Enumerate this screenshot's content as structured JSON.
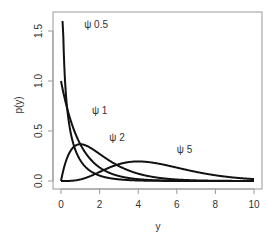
{
  "chart_data": {
    "type": "line",
    "title": "",
    "xlabel": "y",
    "ylabel": "p(y)",
    "xlim": [
      0,
      10
    ],
    "ylim": [
      0,
      1.6
    ],
    "grid": false,
    "legend": "none (inline labels)",
    "x_ticks": [
      0,
      2,
      4,
      6,
      8,
      10
    ],
    "x_tick_labels": [
      "0",
      "2",
      "4",
      "6",
      "8",
      "10"
    ],
    "y_ticks": [
      0.0,
      0.5,
      1.0,
      1.5
    ],
    "y_tick_labels": [
      "0.0",
      "0.5",
      "1.0",
      "1.5"
    ],
    "series": [
      {
        "name": "ψ 0.5",
        "shape": 0.5,
        "label": "ψ  0.5",
        "label_at": [
          1.2,
          1.53
        ],
        "x": [
          0.02,
          0.05,
          0.1,
          0.2,
          0.3,
          0.5,
          0.75,
          1,
          1.5,
          2,
          3,
          4,
          5,
          6,
          8,
          10
        ],
        "values": [
          1.6,
          1.6,
          1.6,
          1.04,
          0.76,
          0.48,
          0.31,
          0.21,
          0.1,
          0.05,
          0.014,
          0.004,
          0.001,
          0.0,
          0.0,
          0.0
        ]
      },
      {
        "name": "ψ 1",
        "shape": 1,
        "label": "ψ  1",
        "label_at": [
          1.6,
          0.67
        ],
        "x": [
          0,
          0.5,
          1,
          1.5,
          2,
          3,
          4,
          5,
          6,
          8,
          10
        ],
        "values": [
          1.0,
          0.61,
          0.37,
          0.22,
          0.14,
          0.05,
          0.02,
          0.007,
          0.002,
          0.0,
          0.0
        ]
      },
      {
        "name": "ψ 2",
        "shape": 2,
        "label": "ψ  2",
        "label_at": [
          2.5,
          0.4
        ],
        "x": [
          0,
          0.5,
          1,
          1.5,
          2,
          3,
          4,
          5,
          6,
          8,
          10
        ],
        "values": [
          0.0,
          0.3,
          0.37,
          0.33,
          0.27,
          0.15,
          0.07,
          0.03,
          0.015,
          0.003,
          0.0
        ]
      },
      {
        "name": "ψ 5",
        "shape": 5,
        "label": "ψ  5",
        "label_at": [
          6.0,
          0.28
        ],
        "x": [
          0,
          1,
          2,
          3,
          4,
          5,
          6,
          7,
          8,
          9,
          10
        ],
        "values": [
          0.0,
          0.015,
          0.09,
          0.17,
          0.195,
          0.175,
          0.13,
          0.09,
          0.057,
          0.034,
          0.019
        ]
      }
    ]
  },
  "axes": {
    "xlabel": "y",
    "ylabel": "p(y)"
  }
}
